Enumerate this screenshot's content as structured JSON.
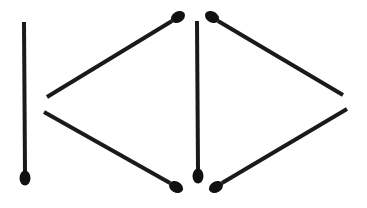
{
  "diagram": {
    "type": "matchstick-puzzle",
    "colors": {
      "stick": "#1a1a1a",
      "head": "#111111",
      "background": "#ffffff"
    },
    "stick_width": 4,
    "sticks": [
      {
        "id": "stick-1",
        "x1": 24,
        "y1": 22,
        "x2": 25,
        "y2": 172,
        "head": {
          "cx": 25,
          "cy": 178,
          "rx": 5.5,
          "ry": 7.5,
          "angle": 0
        }
      },
      {
        "id": "stick-2",
        "x1": 47,
        "y1": 97,
        "x2": 172,
        "y2": 21,
        "head": {
          "cx": 178,
          "cy": 17,
          "rx": 7.5,
          "ry": 5.5,
          "angle": -30
        }
      },
      {
        "id": "stick-3",
        "x1": 44,
        "y1": 112,
        "x2": 170,
        "y2": 183,
        "head": {
          "cx": 176,
          "cy": 187,
          "rx": 7.5,
          "ry": 5.5,
          "angle": 30
        }
      },
      {
        "id": "stick-4",
        "x1": 197,
        "y1": 21,
        "x2": 198,
        "y2": 170,
        "head": {
          "cx": 198,
          "cy": 176,
          "rx": 5.5,
          "ry": 7.5,
          "angle": 0
        }
      },
      {
        "id": "stick-5",
        "x1": 218,
        "y1": 21,
        "x2": 343,
        "y2": 95,
        "head": {
          "cx": 212,
          "cy": 17,
          "rx": 7.5,
          "ry": 5.5,
          "angle": 30
        }
      },
      {
        "id": "stick-6",
        "x1": 222,
        "y1": 183,
        "x2": 347,
        "y2": 109,
        "head": {
          "cx": 216,
          "cy": 187,
          "rx": 7.5,
          "ry": 5.5,
          "angle": -30
        }
      }
    ]
  }
}
